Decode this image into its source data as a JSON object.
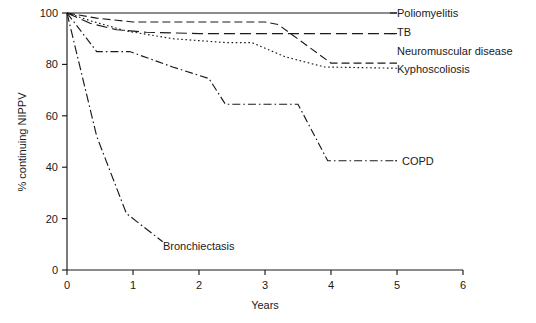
{
  "chart_data": {
    "type": "line",
    "title": "",
    "xlabel": "Years",
    "ylabel": "% continuing NIPPV",
    "xlim": [
      0,
      6
    ],
    "ylim": [
      0,
      100
    ],
    "xticks": [
      "0",
      "1",
      "2",
      "3",
      "4",
      "5",
      "6"
    ],
    "yticks": [
      "0",
      "20",
      "40",
      "60",
      "80",
      "100"
    ],
    "grid": false,
    "legend_position": "inline-right-of-curve-ends",
    "series": [
      {
        "name": "Poliomyelitis",
        "label": "Poliomyelitis",
        "linestyle": "solid",
        "color": "#1a1a1a",
        "x": [
          0,
          0.3,
          1,
          2,
          3,
          4,
          5
        ],
        "y": [
          100,
          100,
          100,
          100,
          100,
          100,
          100
        ]
      },
      {
        "name": "TB",
        "label": "TB",
        "linestyle": "long-dash",
        "color": "#1a1a1a",
        "x": [
          0,
          0.35,
          0.75,
          1.2,
          2,
          3,
          4,
          5
        ],
        "y": [
          100,
          96,
          93.5,
          92.5,
          92,
          92,
          92,
          92
        ]
      },
      {
        "name": "Neuromuscular disease",
        "label": "Neuromuscular disease",
        "linestyle": "medium-dash",
        "color": "#1a1a1a",
        "x": [
          0,
          0.45,
          1.0,
          2.0,
          3.0,
          3.2,
          4.0,
          5.0
        ],
        "y": [
          100,
          98,
          96.5,
          96.5,
          96.5,
          95.5,
          80.5,
          80.5
        ]
      },
      {
        "name": "Kyphoscoliosis",
        "label": "Kyphoscoliosis",
        "linestyle": "dotted",
        "color": "#1a1a1a",
        "x": [
          0,
          0.35,
          0.9,
          1.6,
          2.4,
          2.8,
          3.3,
          3.9,
          5.0
        ],
        "y": [
          100,
          97,
          93,
          90,
          88.5,
          88.5,
          83,
          79,
          78.5
        ]
      },
      {
        "name": "COPD",
        "label": "COPD",
        "linestyle": "dash-dot",
        "color": "#1a1a1a",
        "x": [
          0,
          0.45,
          0.95,
          1.6,
          2.15,
          2.4,
          3.5,
          3.95,
          5.0
        ],
        "y": [
          100,
          85,
          85,
          79,
          74.5,
          64.5,
          64.5,
          42.5,
          42.5
        ]
      },
      {
        "name": "Bronchiectasis",
        "label": "Bronchiectasis",
        "linestyle": "dash-dot-long",
        "color": "#1a1a1a",
        "x": [
          0,
          0.45,
          0.9,
          1.45
        ],
        "y": [
          100,
          52,
          22,
          11
        ]
      }
    ]
  },
  "annotations": {
    "bronchiectasis_label": "Bronchiectasis",
    "copd_label": "COPD"
  }
}
